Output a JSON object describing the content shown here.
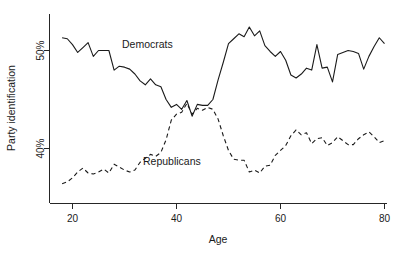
{
  "chart_data": {
    "type": "line",
    "title": "",
    "xlabel": "Age",
    "ylabel": "Party identification",
    "xlim": [
      17,
      81
    ],
    "ylim": [
      35.0,
      53.5
    ],
    "grid": false,
    "legend_position": "inline-annotation",
    "xticks": [
      20,
      40,
      60,
      80
    ],
    "xtick_labels": [
      "20",
      "40",
      "60",
      "80"
    ],
    "yticks": [
      40,
      50
    ],
    "ytick_labels": [
      "40%",
      "50%"
    ],
    "annotations": [
      {
        "text": "Democrats",
        "x": 41,
        "y": 50.2
      },
      {
        "text": "Republicans",
        "x": 48,
        "y": 38.5
      }
    ],
    "x": [
      18,
      19,
      20,
      21,
      22,
      23,
      24,
      25,
      26,
      27,
      28,
      29,
      30,
      31,
      32,
      33,
      34,
      35,
      36,
      37,
      38,
      39,
      40,
      41,
      42,
      43,
      44,
      45,
      46,
      47,
      48,
      49,
      50,
      51,
      52,
      53,
      54,
      55,
      56,
      57,
      58,
      59,
      60,
      61,
      62,
      63,
      64,
      65,
      66,
      67,
      68,
      69,
      70,
      71,
      72,
      73,
      74,
      75,
      76,
      77,
      78,
      79,
      80
    ],
    "series": [
      {
        "name": "Democrats",
        "style": "solid",
        "color": "#1a1a1a",
        "values": [
          51.3,
          51.2,
          50.6,
          49.8,
          50.3,
          50.8,
          49.4,
          50.0,
          50.0,
          50.0,
          48.0,
          48.4,
          48.3,
          48.1,
          47.6,
          46.9,
          46.5,
          47.1,
          46.5,
          46.3,
          45.0,
          44.2,
          44.5,
          44.0,
          44.9,
          43.3,
          44.5,
          44.4,
          44.4,
          45.0,
          47.0,
          48.8,
          50.7,
          51.2,
          51.7,
          51.4,
          52.4,
          51.5,
          52.0,
          50.5,
          49.9,
          49.4,
          49.9,
          49.0,
          47.5,
          47.2,
          47.6,
          48.2,
          48.0,
          50.6,
          48.2,
          48.3,
          46.8,
          49.6,
          49.8,
          50.0,
          49.9,
          49.7,
          48.1,
          49.4,
          50.4,
          51.3,
          50.7
        ]
      },
      {
        "name": "Republicans",
        "style": "dashed",
        "color": "#1a1a1a",
        "values": [
          36.4,
          36.6,
          37.0,
          37.6,
          38.0,
          37.5,
          37.4,
          37.6,
          37.9,
          37.5,
          38.4,
          38.1,
          37.8,
          37.6,
          37.8,
          38.6,
          39.0,
          39.4,
          39.2,
          39.6,
          40.9,
          42.9,
          43.5,
          43.7,
          44.6,
          43.5,
          44.1,
          43.9,
          44.2,
          44.0,
          43.0,
          41.3,
          39.8,
          38.9,
          38.8,
          38.8,
          37.6,
          37.8,
          37.5,
          38.2,
          38.3,
          39.3,
          39.8,
          40.3,
          41.3,
          41.9,
          41.4,
          41.6,
          40.5,
          41.0,
          41.1,
          40.3,
          40.6,
          41.2,
          40.8,
          40.4,
          40.4,
          41.0,
          41.4,
          41.7,
          41.2,
          40.6,
          40.8
        ]
      }
    ]
  },
  "axis": {
    "ylabel": "Party identification",
    "xlabel": "Age",
    "ytick_40": "40%",
    "ytick_50": "50%",
    "xtick_20": "20",
    "xtick_40": "40",
    "xtick_60": "60",
    "xtick_80": "80"
  },
  "labels": {
    "democrats": "Democrats",
    "republicans": "Republicans"
  }
}
